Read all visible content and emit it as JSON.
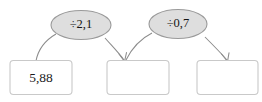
{
  "diagram": {
    "type": "arithmetic-flow-chain",
    "background_color": "#ffffff",
    "box_fill_color": "#ffffff",
    "box_border_color": "#c9c9c9",
    "ellipse_fill_color": "#dedede",
    "ellipse_border_color": "#9a9a9a",
    "connector_color": "#8c8c8c",
    "text_color": "#1b1b1b",
    "boxes": [
      {
        "id": "box-1",
        "value": "5,88",
        "filled": true
      },
      {
        "id": "box-2",
        "value": "",
        "filled": false
      },
      {
        "id": "box-3",
        "value": "",
        "filled": false
      }
    ],
    "operations": [
      {
        "id": "op-1",
        "label": "÷2,1",
        "operator": "÷",
        "operand": "2,1"
      },
      {
        "id": "op-2",
        "label": "÷0,7",
        "operator": "÷",
        "operand": "0,7"
      }
    ],
    "connectors": [
      {
        "id": "conn-box1-op1",
        "from": "box-1",
        "to": "op-1",
        "arrowhead": false
      },
      {
        "id": "conn-op1-box2",
        "from": "op-1",
        "to": "box-2",
        "arrowhead": true
      },
      {
        "id": "conn-box2-op2",
        "from": "box-2",
        "to": "op-2",
        "arrowhead": false
      },
      {
        "id": "conn-op2-box3",
        "from": "op-2",
        "to": "box-3",
        "arrowhead": true
      }
    ]
  }
}
